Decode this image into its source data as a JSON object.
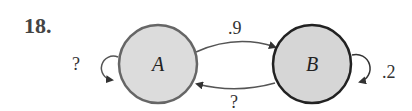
{
  "problem": {
    "number": "18."
  },
  "nodes": [
    {
      "id": "A",
      "label": "A",
      "fill": "#dcdcdc",
      "stroke": "#666666"
    },
    {
      "id": "B",
      "label": "B",
      "fill": "#d6d6d6",
      "stroke": "#222222"
    }
  ],
  "edges": [
    {
      "from": "A",
      "to": "A",
      "label": "?"
    },
    {
      "from": "A",
      "to": "B",
      "label": ".9"
    },
    {
      "from": "B",
      "to": "A",
      "label": "?"
    },
    {
      "from": "B",
      "to": "B",
      "label": ".2"
    }
  ]
}
